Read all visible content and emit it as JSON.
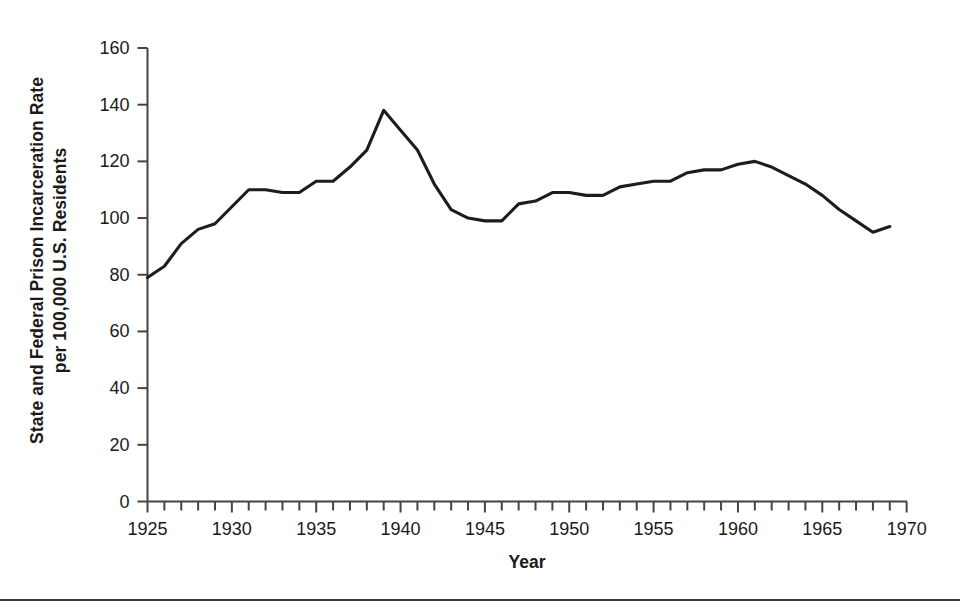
{
  "figure": {
    "background_color": "#ffffff",
    "line_color": "#1d1d1d",
    "axis_color": "#444447",
    "rule_color": "#39393b"
  },
  "axis_titles": {
    "y_line1": "State and Federal Prison Incarceration Rate",
    "y_line2": "per 100,000 U.S. Residents",
    "x": "Year"
  },
  "chart_data": {
    "type": "line",
    "title": "",
    "xlabel": "Year",
    "ylabel": "State and Federal Prison Incarceration Rate per 100,000 U.S. Residents",
    "xlim": [
      1924,
      1970
    ],
    "ylim": [
      0,
      160
    ],
    "ytick_step": 20,
    "xtick_step": 1,
    "xtick_label_step": 5,
    "grid": false,
    "legend": "none",
    "yticks": [
      0,
      20,
      40,
      60,
      80,
      100,
      120,
      140,
      160
    ],
    "ytick_labels": [
      "0",
      "20",
      "40",
      "60",
      "80",
      "100",
      "120",
      "140",
      "160"
    ],
    "xticks": [
      1925,
      1926,
      1927,
      1928,
      1929,
      1930,
      1931,
      1932,
      1933,
      1934,
      1935,
      1936,
      1937,
      1938,
      1939,
      1940,
      1941,
      1942,
      1943,
      1944,
      1945,
      1946,
      1947,
      1948,
      1949,
      1950,
      1951,
      1952,
      1953,
      1954,
      1955,
      1956,
      1957,
      1958,
      1959,
      1960,
      1961,
      1962,
      1963,
      1964,
      1965,
      1966,
      1967,
      1968,
      1969
    ],
    "xtick_labels": [
      "1925",
      "1930",
      "1935",
      "1940",
      "1945",
      "1950",
      "1955",
      "1960",
      "1965",
      "1970"
    ],
    "xtick_label_values": [
      1925,
      1930,
      1935,
      1940,
      1945,
      1950,
      1955,
      1960,
      1965,
      1970
    ],
    "series": [
      {
        "name": "State and Federal Prison Incarceration Rate",
        "x": [
          1925,
          1926,
          1927,
          1928,
          1929,
          1930,
          1931,
          1932,
          1933,
          1934,
          1935,
          1936,
          1937,
          1938,
          1939,
          1940,
          1941,
          1942,
          1943,
          1944,
          1945,
          1946,
          1947,
          1948,
          1949,
          1950,
          1951,
          1952,
          1953,
          1954,
          1955,
          1956,
          1957,
          1958,
          1959,
          1960,
          1961,
          1962,
          1963,
          1964,
          1965,
          1966,
          1967,
          1968,
          1969
        ],
        "values": [
          79,
          83,
          91,
          96,
          98,
          104,
          110,
          110,
          109,
          109,
          113,
          113,
          118,
          124,
          138,
          131,
          124,
          112,
          103,
          100,
          99,
          99,
          105,
          106,
          109,
          109,
          108,
          108,
          111,
          112,
          113,
          113,
          116,
          117,
          117,
          119,
          120,
          118,
          115,
          112,
          108,
          103,
          99,
          95,
          97
        ]
      }
    ]
  }
}
